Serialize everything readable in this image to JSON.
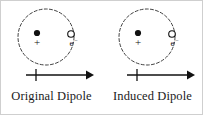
{
  "figure": {
    "background_color": "#ffffff",
    "border_color": "#cfcfcf",
    "ink_color": "#111111"
  },
  "panels": [
    {
      "id": "original-dipole",
      "caption": "Original Dipole",
      "orbit": {
        "icon": "dashed-circle-orbit",
        "cx": 45,
        "cy": 36,
        "r": 28,
        "dashed": true
      },
      "nucleus": {
        "icon": "filled-dot",
        "cx": 36,
        "cy": 32,
        "r": 3.1,
        "charge_label": "+"
      },
      "electron": {
        "icon": "open-circle",
        "cx": 70,
        "cy": 33,
        "r": 3.3,
        "label": "e",
        "superscript": "−"
      },
      "arrow": {
        "icon": "right-arrow",
        "x1": 25,
        "x2": 92,
        "y": 74,
        "tick_x": 35,
        "tick_half_height": 6,
        "direction": "right"
      }
    },
    {
      "id": "induced-dipole",
      "caption": "Induced Dipole",
      "orbit": {
        "icon": "dashed-circle-orbit",
        "cx": 45,
        "cy": 36,
        "r": 28,
        "dashed": true
      },
      "nucleus": {
        "icon": "filled-dot",
        "cx": 36,
        "cy": 32,
        "r": 3.1,
        "charge_label": "+"
      },
      "electron": {
        "icon": "open-circle",
        "cx": 70,
        "cy": 33,
        "r": 3.3,
        "label": "e",
        "superscript": "−"
      },
      "arrow": {
        "icon": "right-arrow",
        "x1": 25,
        "x2": 92,
        "y": 74,
        "tick_x": 35,
        "tick_half_height": 6,
        "direction": "right"
      }
    }
  ]
}
